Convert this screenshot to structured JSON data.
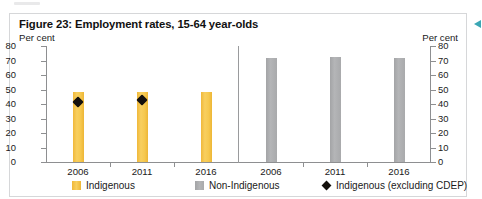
{
  "figure": {
    "title": "Figure 23: Employment rates, 15-64 year-olds",
    "unit_left": "Per cent",
    "unit_right": "Per cent"
  },
  "legend": {
    "items": [
      {
        "label": "Indigenous",
        "marker": "yellow-square-swatch",
        "color": "#f6c84e"
      },
      {
        "label": "Non-Indigenous",
        "marker": "grey-square-swatch",
        "color": "#a9aaac"
      },
      {
        "label": "Indigenous (excluding CDEP)",
        "marker": "black-diamond-marker",
        "color": "#14100c"
      }
    ]
  },
  "annotations": {
    "margin_arrow": "left-pointing-arrow-icon",
    "margin_arrow_color": "#3ba7b5"
  },
  "chart_data": {
    "type": "bar",
    "title": "Figure 23: Employment rates, 15-64 year-olds",
    "xlabel": "",
    "ylabel": "Per cent",
    "ylim": [
      0,
      80
    ],
    "yticks": [
      0,
      10,
      20,
      30,
      40,
      50,
      60,
      70,
      80
    ],
    "grid": false,
    "legend_position": "bottom",
    "dual_axis": true,
    "panels": [
      {
        "name": "Indigenous",
        "categories": [
          "2006",
          "2011",
          "2016"
        ],
        "series": [
          {
            "name": "Indigenous",
            "type": "bar",
            "color": "#f6c84e",
            "values": [
              48,
              48,
              48
            ]
          },
          {
            "name": "Indigenous (excluding CDEP)",
            "type": "marker",
            "marker": "diamond",
            "color": "#14100c",
            "values": [
              44,
              45.5,
              null
            ]
          }
        ]
      },
      {
        "name": "Non-Indigenous",
        "categories": [
          "2006",
          "2011",
          "2016"
        ],
        "series": [
          {
            "name": "Non-Indigenous",
            "type": "bar",
            "color": "#a9aaac",
            "values": [
              72,
              72.5,
              72
            ]
          }
        ]
      }
    ]
  }
}
